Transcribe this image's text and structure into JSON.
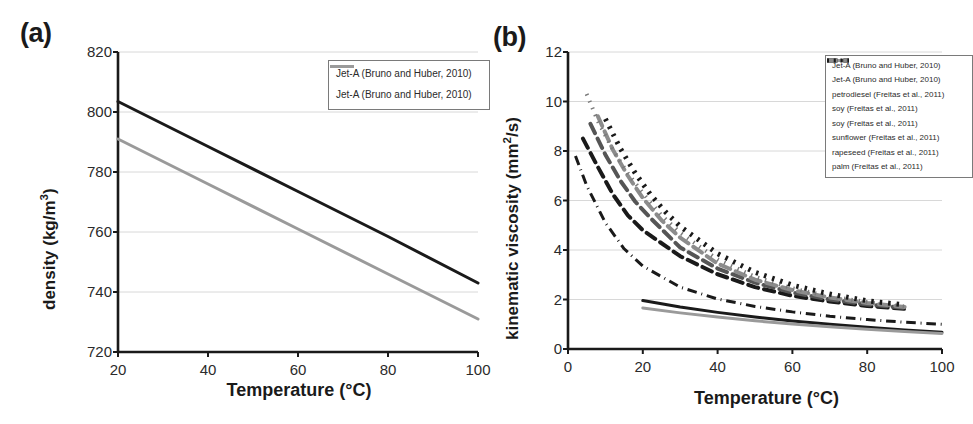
{
  "figure": {
    "panels": [
      {
        "id": "a",
        "label": "(a)",
        "xlabel": "Temperature (°C)",
        "ylabel_html": "density (kg/m<sup>3</sup>)",
        "ylabel": "density (kg/m3)"
      },
      {
        "id": "b",
        "label": "(b)",
        "xlabel": "Temperature (°C)",
        "ylabel_html": "kinematic viscosity (mm<sup>2</sup>/s)",
        "ylabel": "kinematic viscosity (mm2/s)"
      }
    ]
  },
  "chart_data": [
    {
      "type": "line",
      "panel": "a",
      "title": "(a)",
      "xlabel": "Temperature (°C)",
      "ylabel": "density (kg/m3)",
      "xlim": [
        20,
        100
      ],
      "ylim": [
        720,
        820
      ],
      "xticks": [
        20,
        40,
        60,
        80,
        100
      ],
      "yticks": [
        720,
        740,
        760,
        780,
        800,
        820
      ],
      "grid": true,
      "legend_position": "top-right",
      "series": [
        {
          "name": "Jet-A (Bruno and Huber, 2010)",
          "style": "solid",
          "color": "#1a1a1a",
          "width": 3,
          "x": [
            20,
            40,
            60,
            80,
            100
          ],
          "y": [
            803.5,
            788.5,
            773.5,
            758.5,
            743.0
          ]
        },
        {
          "name": "Jet-A (Bruno and Huber, 2010)",
          "style": "solid",
          "color": "#9a9a9a",
          "width": 3,
          "x": [
            20,
            40,
            60,
            80,
            100
          ],
          "y": [
            791.0,
            776.0,
            761.0,
            746.0,
            731.0
          ]
        }
      ]
    },
    {
      "type": "line",
      "panel": "b",
      "title": "(b)",
      "xlabel": "Temperature (°C)",
      "ylabel": "kinematic viscosity (mm2/s)",
      "xlim": [
        0,
        100
      ],
      "ylim": [
        0,
        12
      ],
      "xticks": [
        0,
        20,
        40,
        60,
        80,
        100
      ],
      "yticks": [
        0,
        2,
        4,
        6,
        8,
        10,
        12
      ],
      "grid": true,
      "legend_position": "top-right",
      "series": [
        {
          "name": "Jet-A (Bruno and Huber, 2010)",
          "style": "solid",
          "color": "#1a1a1a",
          "width": 3,
          "x": [
            20,
            30,
            40,
            50,
            60,
            70,
            80,
            90,
            100
          ],
          "y": [
            1.96,
            1.7,
            1.48,
            1.29,
            1.13,
            1.0,
            0.88,
            0.77,
            0.68
          ]
        },
        {
          "name": "Jet-A (Bruno and Huber, 2010)",
          "style": "solid",
          "color": "#9a9a9a",
          "width": 3,
          "x": [
            20,
            30,
            40,
            50,
            60,
            70,
            80,
            90,
            100
          ],
          "y": [
            1.66,
            1.46,
            1.29,
            1.14,
            1.01,
            0.9,
            0.8,
            0.71,
            0.63
          ]
        },
        {
          "name": "petrodiesel (Freitas et al., 2011)",
          "style": "dashdot",
          "color": "#1a1a1a",
          "width": 3,
          "x": [
            2,
            5,
            10,
            15,
            20,
            30,
            40,
            50,
            60,
            70,
            80,
            90,
            100
          ],
          "y": [
            7.8,
            6.6,
            5.1,
            4.05,
            3.35,
            2.5,
            2.02,
            1.72,
            1.5,
            1.32,
            1.19,
            1.08,
            1.0
          ]
        },
        {
          "name": "soy (Freitas et al., 2011)",
          "style": "dashed",
          "color": "#1a1a1a",
          "width": 4,
          "x": [
            4,
            8,
            12,
            16,
            20,
            30,
            40,
            50,
            60,
            70,
            80,
            90
          ],
          "y": [
            8.5,
            7.35,
            6.25,
            5.4,
            4.8,
            3.75,
            3.02,
            2.5,
            2.15,
            1.92,
            1.74,
            1.62
          ]
        },
        {
          "name": "soy (Freitas et al., 2011)",
          "style": "dashed",
          "color": "#555555",
          "width": 4,
          "x": [
            6,
            10,
            14,
            18,
            22,
            30,
            40,
            50,
            60,
            70,
            80,
            90
          ],
          "y": [
            9.1,
            7.85,
            6.8,
            5.95,
            5.3,
            4.1,
            3.25,
            2.68,
            2.28,
            2.0,
            1.8,
            1.66
          ]
        },
        {
          "name": "sunflower (Freitas et al., 2011)",
          "style": "dashed",
          "color": "#8c8c8c",
          "width": 4,
          "x": [
            8,
            12,
            16,
            20,
            25,
            30,
            40,
            50,
            60,
            70,
            80,
            90
          ],
          "y": [
            9.4,
            8.05,
            7.0,
            6.1,
            5.2,
            4.5,
            3.45,
            2.8,
            2.38,
            2.08,
            1.86,
            1.7
          ]
        },
        {
          "name": "rapeseed (Freitas et al., 2011)",
          "style": "dotted",
          "color": "#7a7a7a",
          "width": 4,
          "x": [
            5,
            8,
            12,
            16,
            20,
            25,
            30,
            40,
            50,
            60,
            70,
            80,
            90
          ],
          "y": [
            10.3,
            9.2,
            8.05,
            7.1,
            6.3,
            5.4,
            4.7,
            3.62,
            2.92,
            2.45,
            2.12,
            1.9,
            1.72
          ]
        },
        {
          "name": "palm (Freitas et al., 2011)",
          "style": "dotted-thick",
          "color": "#1a1a1a",
          "width": 5,
          "x": [
            10,
            14,
            18,
            22,
            26,
            30,
            40,
            50,
            60,
            70,
            80,
            90
          ],
          "y": [
            9.3,
            8.1,
            7.1,
            6.25,
            5.55,
            4.95,
            3.85,
            3.1,
            2.58,
            2.22,
            1.95,
            1.78
          ]
        }
      ]
    }
  ],
  "panel_a": {
    "label": "(a)",
    "xlabel": "Temperature (°C)",
    "yticks": [
      "820",
      "800",
      "780",
      "760",
      "740",
      "720"
    ],
    "xticks": [
      "20",
      "40",
      "60",
      "80",
      "100"
    ],
    "legend": {
      "items": [
        {
          "label": "Jet-A (Bruno and Huber, 2010)",
          "color": "#1a1a1a",
          "style": "solid"
        },
        {
          "label": "Jet-A (Bruno and Huber, 2010)",
          "color": "#9a9a9a",
          "style": "solid"
        }
      ]
    }
  },
  "panel_b": {
    "label": "(b)",
    "xlabel": "Temperature (°C)",
    "yticks": [
      "12",
      "10",
      "8",
      "6",
      "4",
      "2",
      "0"
    ],
    "xticks": [
      "0",
      "20",
      "40",
      "60",
      "80",
      "100"
    ],
    "legend": {
      "items": [
        {
          "label": "Jet-A (Bruno and Huber, 2010)",
          "color": "#1a1a1a",
          "style": "solid"
        },
        {
          "label": "Jet-A (Bruno and Huber, 2010)",
          "color": "#9a9a9a",
          "style": "solid"
        },
        {
          "label": "petrodiesel (Freitas et al., 2011)",
          "color": "#1a1a1a",
          "style": "dashdot"
        },
        {
          "label": "soy (Freitas et al., 2011)",
          "color": "#1a1a1a",
          "style": "dashed"
        },
        {
          "label": "soy (Freitas et al., 2011)",
          "color": "#555555",
          "style": "dashed"
        },
        {
          "label": "sunflower (Freitas et al., 2011)",
          "color": "#8c8c8c",
          "style": "dashed"
        },
        {
          "label": "rapeseed (Freitas et al., 2011)",
          "color": "#7a7a7a",
          "style": "dotted"
        },
        {
          "label": "palm (Freitas et al., 2011)",
          "color": "#1a1a1a",
          "style": "dotted-thick"
        }
      ]
    }
  },
  "colors": {
    "axis": "#1a1a1a",
    "grid": "#d8d8d8",
    "dark_series": "#1a1a1a",
    "gray_series": "#9a9a9a",
    "background": "#ffffff"
  }
}
